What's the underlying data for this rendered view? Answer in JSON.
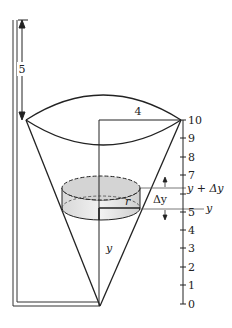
{
  "diagram": {
    "pipe_height_label": "5",
    "radius_label": "4",
    "slice_radius_label": "r",
    "height_var_label": "y",
    "delta_label": "Δy",
    "axis_upper_label": "y + Δy",
    "axis_lower_label": "y",
    "axis_ticks": [
      "0",
      "1",
      "2",
      "3",
      "4",
      "5",
      "6",
      "7",
      "8",
      "9",
      "10"
    ],
    "axis_tick_labels_shown": [
      "0",
      "1",
      "2",
      "3",
      "4",
      "5",
      "7",
      "8",
      "9",
      "10"
    ]
  }
}
